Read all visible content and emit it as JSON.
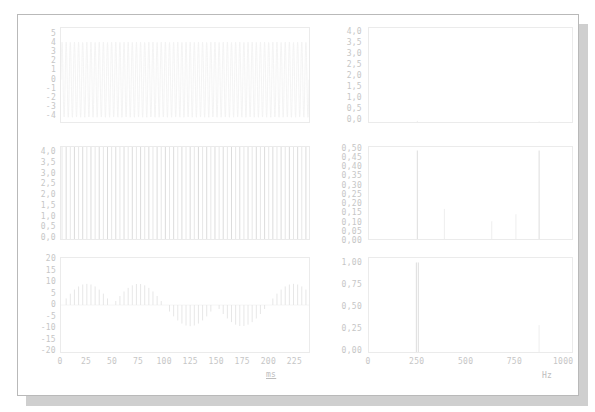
{
  "figure": {
    "kind": "signal-analysis-multipanel",
    "columns": 2,
    "rows": 3,
    "background": "#ffffff",
    "line_color": "#e0e0e0",
    "label_color": "#c6c6c6"
  },
  "axis_titles": {
    "time": "ms",
    "frequency": "Hz"
  },
  "chart_data": [
    {
      "id": "time-carrier",
      "type": "line",
      "title": "",
      "xlabel": "ms",
      "ylabel": "",
      "xlim": [
        0,
        240
      ],
      "ylim": [
        -4.5,
        5.5
      ],
      "yticks": [
        5,
        4,
        3,
        2,
        1,
        0,
        -1,
        -2,
        -3,
        -4
      ],
      "ytick_labels": [
        "5",
        "4",
        "3",
        "2",
        "1",
        "0",
        "-1",
        "-2",
        "-3",
        "-4"
      ],
      "xticks": [
        0,
        25,
        50,
        75,
        100,
        125,
        150,
        175,
        200,
        225
      ],
      "xtick_labels": [
        "0",
        "25",
        "50",
        "75",
        "100",
        "125",
        "150",
        "175",
        "200",
        "225"
      ],
      "grid": false,
      "series": [
        {
          "name": "carrier waveform",
          "description": "very faint high-frequency oscillation, amplitude ~4",
          "amplitude": 4.0,
          "frequency_hz": 250,
          "samples_hint": "sin(2*pi*250*t) * 4"
        }
      ]
    },
    {
      "id": "time-impulse-train",
      "type": "line",
      "title": "",
      "xlabel": "ms",
      "ylabel": "",
      "xlim": [
        0,
        240
      ],
      "ylim": [
        0,
        4.2
      ],
      "yticks": [
        4.0,
        3.5,
        3.0,
        2.5,
        2.0,
        1.5,
        1.0,
        0.5,
        0.0
      ],
      "ytick_labels": [
        "4,0",
        "3,5",
        "3,0",
        "2,5",
        "2,0",
        "1,5",
        "1,0",
        "0,5",
        "0,0"
      ],
      "xticks": [
        0,
        25,
        50,
        75,
        100,
        125,
        150,
        175,
        200,
        225
      ],
      "xtick_labels": [
        "0",
        "25",
        "50",
        "75",
        "100",
        "125",
        "150",
        "175",
        "200",
        "225"
      ],
      "grid": false,
      "series": [
        {
          "name": "rectified impulse train",
          "description": "regular full-height vertical stems, period ~4 ms",
          "stem_period_ms": 4,
          "stem_height": 4.0,
          "stem_count": 60
        }
      ]
    },
    {
      "id": "time-beat-envelope",
      "type": "line",
      "title": "",
      "xlabel": "ms",
      "ylabel": "",
      "xlim": [
        0,
        240
      ],
      "ylim": [
        -20,
        20
      ],
      "yticks": [
        20,
        15,
        10,
        5,
        0,
        -5,
        -10,
        -15,
        -20
      ],
      "ytick_labels": [
        "20",
        "15",
        "10",
        "5",
        "0",
        "-5",
        "-10",
        "-15",
        "-20"
      ],
      "xticks": [
        0,
        25,
        50,
        75,
        100,
        125,
        150,
        175,
        200,
        225
      ],
      "xtick_labels": [
        "0",
        "25",
        "50",
        "75",
        "100",
        "125",
        "150",
        "175",
        "200",
        "225"
      ],
      "grid": false,
      "series": [
        {
          "name": "beating signal",
          "description": "alternating positive and negative lobes of stems, beat period ~100 ms",
          "envelope_peak": 18,
          "beat_period_ms": 100,
          "stem_period_ms": 4
        }
      ]
    },
    {
      "id": "spectrum-carrier",
      "type": "bar",
      "title": "",
      "xlabel": "Hz",
      "ylabel": "",
      "xlim": [
        0,
        1050
      ],
      "ylim": [
        0,
        4.2
      ],
      "yticks": [
        4.0,
        3.5,
        3.0,
        2.5,
        2.0,
        1.5,
        1.0,
        0.5,
        0.0
      ],
      "ytick_labels": [
        "4,0",
        "3,5",
        "3,0",
        "2,5",
        "2,0",
        "1,5",
        "1,0",
        "0,5",
        "0,0"
      ],
      "xticks": [
        0,
        250,
        500,
        750,
        1000
      ],
      "xtick_labels": [
        "0",
        "250",
        "500",
        "750",
        "1000"
      ],
      "grid": false,
      "peaks": [
        {
          "frequency": 250,
          "amplitude": 0.05
        },
        {
          "frequency": 880,
          "amplitude": 0.03
        }
      ]
    },
    {
      "id": "spectrum-harmonics",
      "type": "bar",
      "title": "",
      "xlabel": "Hz",
      "ylabel": "",
      "xlim": [
        0,
        1050
      ],
      "ylim": [
        0,
        0.52
      ],
      "yticks": [
        0.5,
        0.45,
        0.4,
        0.35,
        0.3,
        0.25,
        0.2,
        0.15,
        0.1,
        0.05,
        0.0
      ],
      "ytick_labels": [
        "0,50",
        "0,45",
        "0,40",
        "0,35",
        "0,30",
        "0,25",
        "0,20",
        "0,15",
        "0,10",
        "0,05",
        "0,00"
      ],
      "xticks": [
        0,
        250,
        500,
        750,
        1000
      ],
      "xtick_labels": [
        "0",
        "250",
        "500",
        "750",
        "1000"
      ],
      "grid": false,
      "peaks": [
        {
          "frequency": 250,
          "amplitude": 0.5
        },
        {
          "frequency": 390,
          "amplitude": 0.17
        },
        {
          "frequency": 635,
          "amplitude": 0.1
        },
        {
          "frequency": 760,
          "amplitude": 0.14
        },
        {
          "frequency": 880,
          "amplitude": 0.5
        }
      ]
    },
    {
      "id": "spectrum-beat-pair",
      "type": "bar",
      "title": "",
      "xlabel": "Hz",
      "ylabel": "",
      "xlim": [
        0,
        1050
      ],
      "ylim": [
        0,
        1.05
      ],
      "yticks": [
        1.0,
        0.75,
        0.5,
        0.25,
        0.0
      ],
      "ytick_labels": [
        "1,00",
        "0,75",
        "0,50",
        "0,25",
        "0,00"
      ],
      "xticks": [
        0,
        250,
        500,
        750,
        1000
      ],
      "xtick_labels": [
        "0",
        "250",
        "500",
        "750",
        "1000"
      ],
      "grid": false,
      "peaks": [
        {
          "frequency": 245,
          "amplitude": 1.0
        },
        {
          "frequency": 255,
          "amplitude": 1.0
        },
        {
          "frequency": 880,
          "amplitude": 0.3
        }
      ]
    }
  ]
}
